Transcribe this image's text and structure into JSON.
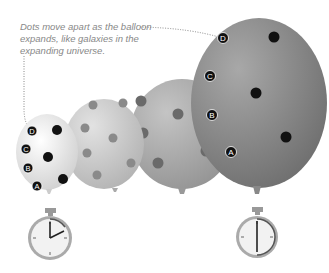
{
  "caption": "Dots move apart as the balloon expands, like galaxies in the expanding universe.",
  "balloons": [
    {
      "stage": 1,
      "size": "small",
      "labels": [
        "A",
        "B",
        "C",
        "D"
      ]
    },
    {
      "stage": 2,
      "size": "medium",
      "labels": []
    },
    {
      "stage": 3,
      "size": "large",
      "labels": []
    },
    {
      "stage": 4,
      "size": "largest",
      "labels": [
        "A",
        "B",
        "C",
        "D"
      ]
    }
  ],
  "labels": {
    "a": "A",
    "b": "B",
    "c": "C",
    "d": "D"
  },
  "stopwatches": [
    {
      "position": "left",
      "hand": "early",
      "under_balloon": 1
    },
    {
      "position": "right",
      "hand": "later",
      "under_balloon": 4
    }
  ],
  "colors": {
    "small": "#e6e6e6",
    "medium": "#c8c8c8",
    "large": "#a8a8a8",
    "largest": "#8a8a8a",
    "dot": "#111111",
    "caption": "#888888"
  }
}
